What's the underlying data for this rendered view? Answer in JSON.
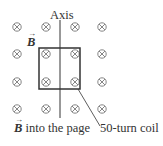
{
  "diagram": {
    "axis_label": "Axis",
    "field_symbol": "B",
    "field_label_suffix": " into the page",
    "coil_label": "50-turn coil",
    "field_glyph": "⊗",
    "grid": {
      "columns_x": [
        17,
        46,
        75,
        102
      ],
      "rows_y": [
        27,
        54,
        82,
        109
      ]
    },
    "coil": {
      "left": 39,
      "top": 48,
      "width": 41,
      "height": 41
    },
    "axis_x": 60,
    "colors": {
      "ink": "#333333",
      "field": "#666666"
    }
  }
}
